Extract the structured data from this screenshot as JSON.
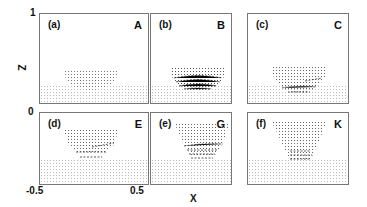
{
  "axes": {
    "z_label": "Z",
    "x_label": "X",
    "z_ticks": [
      "1",
      "0"
    ],
    "x_ticks": [
      "-0.5",
      "0.5"
    ]
  },
  "panels": [
    {
      "label": "(a)",
      "letter": "A"
    },
    {
      "label": "(b)",
      "letter": "B"
    },
    {
      "label": "(c)",
      "letter": "C"
    },
    {
      "label": "(d)",
      "letter": "E"
    },
    {
      "label": "(e)",
      "letter": "G"
    },
    {
      "label": "(f)",
      "letter": "K"
    }
  ]
}
